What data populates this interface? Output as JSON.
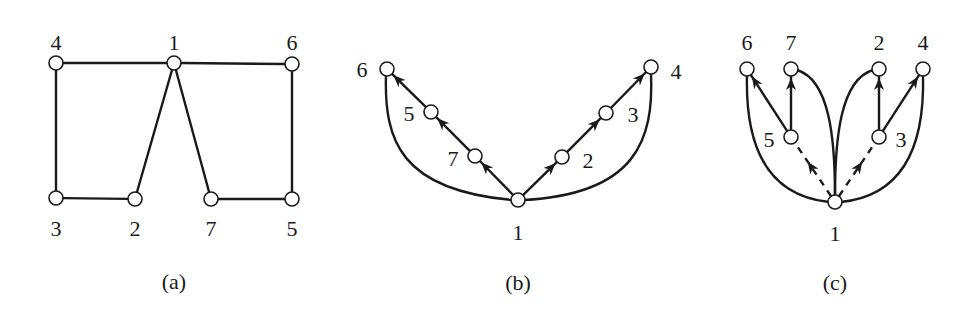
{
  "diagrams": [
    {
      "id": "a",
      "caption": "(a)",
      "caption_pos": [
        174,
        281
      ],
      "type": "undirected-graph",
      "nodes": [
        {
          "id": "4",
          "x": 56,
          "y": 63,
          "label": "4",
          "lx": 56,
          "ly": 42
        },
        {
          "id": "1",
          "x": 174,
          "y": 63,
          "label": "1",
          "lx": 174,
          "ly": 42
        },
        {
          "id": "6",
          "x": 292,
          "y": 64,
          "label": "6",
          "lx": 292,
          "ly": 42
        },
        {
          "id": "3",
          "x": 56,
          "y": 198,
          "label": "3",
          "lx": 56,
          "ly": 228
        },
        {
          "id": "2",
          "x": 135,
          "y": 199,
          "label": "2",
          "lx": 135,
          "ly": 228
        },
        {
          "id": "7",
          "x": 211,
          "y": 199,
          "label": "7",
          "lx": 211,
          "ly": 228
        },
        {
          "id": "5",
          "x": 292,
          "y": 199,
          "label": "5",
          "lx": 292,
          "ly": 228
        }
      ],
      "edges": [
        {
          "from": "4",
          "to": "1",
          "style": "solid",
          "arrow": false
        },
        {
          "from": "1",
          "to": "6",
          "style": "solid",
          "arrow": false
        },
        {
          "from": "4",
          "to": "3",
          "style": "solid",
          "arrow": false
        },
        {
          "from": "3",
          "to": "2",
          "style": "solid",
          "arrow": false
        },
        {
          "from": "2",
          "to": "1",
          "style": "solid",
          "arrow": false
        },
        {
          "from": "1",
          "to": "7",
          "style": "solid",
          "arrow": false
        },
        {
          "from": "7",
          "to": "5",
          "style": "solid",
          "arrow": false
        },
        {
          "from": "6",
          "to": "5",
          "style": "solid",
          "arrow": false
        }
      ]
    },
    {
      "id": "b",
      "caption": "(b)",
      "caption_pos": [
        518,
        282
      ],
      "type": "dfs-tree",
      "nodes": [
        {
          "id": "6",
          "x": 387,
          "y": 69,
          "label": "6",
          "lx": 362,
          "ly": 69
        },
        {
          "id": "5",
          "x": 431,
          "y": 112,
          "label": "5",
          "lx": 409,
          "ly": 113
        },
        {
          "id": "7",
          "x": 475,
          "y": 156,
          "label": "7",
          "lx": 453,
          "ly": 158
        },
        {
          "id": "1",
          "x": 518,
          "y": 200,
          "label": "1",
          "lx": 518,
          "ly": 232
        },
        {
          "id": "2",
          "x": 562,
          "y": 157,
          "label": "2",
          "lx": 588,
          "ly": 160
        },
        {
          "id": "3",
          "x": 606,
          "y": 113,
          "label": "3",
          "lx": 633,
          "ly": 114
        },
        {
          "id": "4",
          "x": 651,
          "y": 67,
          "label": "4",
          "lx": 676,
          "ly": 71
        }
      ],
      "edges": [
        {
          "from": "1",
          "to": "7",
          "style": "solid",
          "arrow": true
        },
        {
          "from": "7",
          "to": "5",
          "style": "solid",
          "arrow": true
        },
        {
          "from": "5",
          "to": "6",
          "style": "solid",
          "arrow": true
        },
        {
          "from": "1",
          "to": "2",
          "style": "solid",
          "arrow": true
        },
        {
          "from": "2",
          "to": "3",
          "style": "solid",
          "arrow": true
        },
        {
          "from": "3",
          "to": "4",
          "style": "solid",
          "arrow": true
        },
        {
          "from": "6",
          "to": "1",
          "style": "solid",
          "arrow": false,
          "curve": "M 386 75 C 384 140, 400 190, 512 200"
        },
        {
          "from": "4",
          "to": "1",
          "style": "solid",
          "arrow": false,
          "curve": "M 651 73 C 654 140, 636 194, 524 200"
        }
      ]
    },
    {
      "id": "c",
      "caption": "(c)",
      "caption_pos": [
        835,
        282
      ],
      "type": "bfs-tree",
      "nodes": [
        {
          "id": "6",
          "x": 747,
          "y": 69,
          "label": "6",
          "lx": 747,
          "ly": 42
        },
        {
          "id": "7",
          "x": 791,
          "y": 69,
          "label": "7",
          "lx": 791,
          "ly": 42
        },
        {
          "id": "2",
          "x": 879,
          "y": 69,
          "label": "2",
          "lx": 879,
          "ly": 42
        },
        {
          "id": "4",
          "x": 923,
          "y": 69,
          "label": "4",
          "lx": 923,
          "ly": 42
        },
        {
          "id": "5",
          "x": 791,
          "y": 137,
          "label": "5",
          "lx": 769,
          "ly": 139
        },
        {
          "id": "3",
          "x": 879,
          "y": 137,
          "label": "3",
          "lx": 901,
          "ly": 139
        },
        {
          "id": "1",
          "x": 835,
          "y": 202,
          "label": "1",
          "lx": 835,
          "ly": 233
        }
      ],
      "edges": [
        {
          "from": "1",
          "to": "5",
          "style": "dashed",
          "arrow": true
        },
        {
          "from": "1",
          "to": "3",
          "style": "dashed",
          "arrow": true
        },
        {
          "from": "5",
          "to": "6",
          "style": "solid",
          "arrow": true
        },
        {
          "from": "5",
          "to": "7",
          "style": "solid",
          "arrow": true
        },
        {
          "from": "3",
          "to": "2",
          "style": "solid",
          "arrow": true
        },
        {
          "from": "3",
          "to": "4",
          "style": "solid",
          "arrow": true
        },
        {
          "from": "6",
          "to": "1",
          "style": "solid",
          "arrow": false,
          "curve": "M 747 75 C 745 150, 770 196, 829 202"
        },
        {
          "from": "4",
          "to": "1",
          "style": "solid",
          "arrow": false,
          "curve": "M 923 75 C 925 150, 900 196, 841 202"
        },
        {
          "from": "7",
          "to": "1",
          "style": "solid",
          "arrow": false,
          "curve": "M 797 70 C 830 80, 835 140, 835 196"
        },
        {
          "from": "2",
          "to": "1",
          "style": "solid",
          "arrow": false,
          "curve": "M 873 70 C 840 80, 835 140, 835 196"
        }
      ]
    }
  ],
  "style": {
    "ink": "#1a1a1a",
    "background": "#ffffff",
    "node_radius": 7
  }
}
